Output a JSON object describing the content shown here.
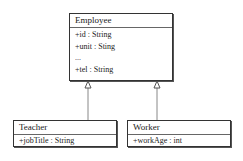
{
  "diagram": {
    "type": "uml-class-inheritance",
    "classes": [
      {
        "name": "Employee",
        "attributes": [
          "+id : String",
          "+unit : Sting",
          "...",
          "+tel : String"
        ]
      },
      {
        "name": "Teacher",
        "attributes": [
          "+jobTitle : String"
        ]
      },
      {
        "name": "Worker",
        "attributes": [
          "+workAge : int"
        ]
      }
    ],
    "relations": [
      {
        "from": "Teacher",
        "to": "Employee",
        "type": "generalization"
      },
      {
        "from": "Worker",
        "to": "Employee",
        "type": "generalization"
      }
    ]
  }
}
